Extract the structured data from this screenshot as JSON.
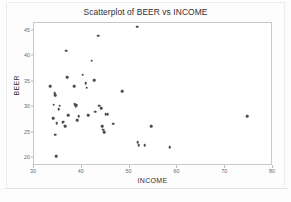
{
  "chart_data": {
    "type": "scatter",
    "title": "Scatterplot of BEER vs INCOME",
    "xlabel": "INCOME",
    "ylabel": "BEER",
    "xlim": [
      30,
      80
    ],
    "ylim": [
      18.5,
      46.5
    ],
    "xticks": [
      30,
      40,
      50,
      60,
      70,
      80
    ],
    "yticks": [
      20,
      25,
      30,
      35,
      40,
      45
    ],
    "grid": false,
    "legend": null,
    "marker": {
      "shape": "circle",
      "color": "#4a4a52",
      "size": 2.6
    },
    "frame_color": "#c8c8cc",
    "background": "#ffffff",
    "series": [
      {
        "name": "BEER vs INCOME",
        "points": [
          [
            33.6,
            33.9
          ],
          [
            34.3,
            30.3
          ],
          [
            34.5,
            32.6
          ],
          [
            34.6,
            32.2
          ],
          [
            34.2,
            27.7
          ],
          [
            34.7,
            24.4
          ],
          [
            34.9,
            20.2
          ],
          [
            35.0,
            26.7
          ],
          [
            35.4,
            29.4
          ],
          [
            35.6,
            30.1
          ],
          [
            36.2,
            26.9
          ],
          [
            36.4,
            27.0
          ],
          [
            36.6,
            26.2
          ],
          [
            36.7,
            26.1
          ],
          [
            37.0,
            40.9
          ],
          [
            37.1,
            35.7
          ],
          [
            37.4,
            28.2
          ],
          [
            38.6,
            33.9
          ],
          [
            38.7,
            30.4
          ],
          [
            38.9,
            29.9
          ],
          [
            39.1,
            30.2
          ],
          [
            39.3,
            27.3
          ],
          [
            39.6,
            28.1
          ],
          [
            40.4,
            36.2
          ],
          [
            41.0,
            34.5
          ],
          [
            41.2,
            33.6
          ],
          [
            41.5,
            28.3
          ],
          [
            42.3,
            38.9
          ],
          [
            42.8,
            35.1
          ],
          [
            43.0,
            28.9
          ],
          [
            43.6,
            43.8
          ],
          [
            43.9,
            30.1
          ],
          [
            44.3,
            29.6
          ],
          [
            44.5,
            26.1
          ],
          [
            44.7,
            25.4
          ],
          [
            44.9,
            24.9
          ],
          [
            45.2,
            28.5
          ],
          [
            45.6,
            28.4
          ],
          [
            46.8,
            26.6
          ],
          [
            48.7,
            32.9
          ],
          [
            51.8,
            45.6
          ],
          [
            51.9,
            23.0
          ],
          [
            52.1,
            22.4
          ],
          [
            53.4,
            22.4
          ],
          [
            54.7,
            26.1
          ],
          [
            58.6,
            22.0
          ],
          [
            74.8,
            28.1
          ]
        ]
      }
    ]
  }
}
